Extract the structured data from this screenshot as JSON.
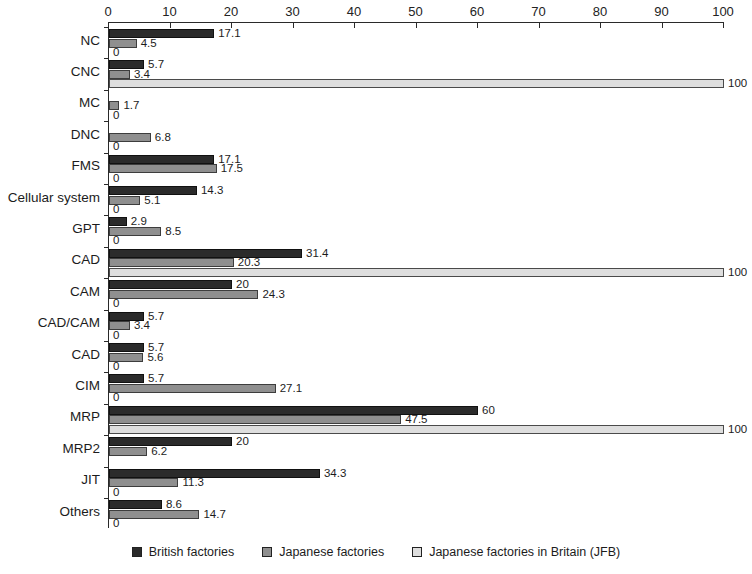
{
  "chart_data": {
    "type": "bar",
    "orientation": "horizontal",
    "title": "",
    "subtitle": "",
    "xlabel": "",
    "ylabel": "",
    "xlim": [
      0,
      100
    ],
    "xticks": [
      0,
      10,
      20,
      30,
      40,
      50,
      60,
      70,
      80,
      90,
      100
    ],
    "grid": false,
    "legend_position": "bottom",
    "categories": [
      "NC",
      "CNC",
      "MC",
      "DNC",
      "FMS",
      "Cellular system",
      "GPT",
      "CAD",
      "CAM",
      "CAD/CAM",
      "CAD",
      "CIM",
      "MRP",
      "MRP2",
      "JIT",
      "Others"
    ],
    "series": [
      {
        "name": "British factories",
        "color": "#2b2b2b",
        "values": [
          17.1,
          5.7,
          0,
          0,
          17.1,
          14.3,
          2.9,
          31.4,
          20,
          5.7,
          5.7,
          5.7,
          60,
          20,
          34.3,
          8.6
        ],
        "labels": [
          "17.1",
          "5.7",
          "",
          "",
          "17.1",
          "14.3",
          "2.9",
          "31.4",
          "20",
          "5.7",
          "5.7",
          "5.7",
          "60",
          "20",
          "34.3",
          "8.6"
        ]
      },
      {
        "name": "Japanese factories",
        "color": "#8f8f8f",
        "values": [
          4.5,
          3.4,
          1.7,
          6.8,
          17.5,
          5.1,
          8.5,
          20.3,
          24.3,
          3.4,
          5.6,
          27.1,
          47.5,
          6.2,
          11.3,
          14.7
        ],
        "labels": [
          "4.5",
          "3.4",
          "1.7",
          "6.8",
          "17.5",
          "5.1",
          "8.5",
          "20.3",
          "24.3",
          "3.4",
          "5.6",
          "27.1",
          "47.5",
          "6.2",
          "11.3",
          "14.7"
        ]
      },
      {
        "name": "Japanese factories in Britain (JFB)",
        "color": "#dedede",
        "values": [
          0,
          100,
          0,
          0,
          0,
          0,
          0,
          100,
          0,
          0,
          0,
          0,
          100,
          0,
          0,
          0
        ],
        "labels": [
          "0",
          "100",
          "0",
          "0",
          "0",
          "0",
          "0",
          "100",
          "0",
          "0",
          "0",
          "0",
          "100",
          "",
          "0",
          "0"
        ]
      }
    ]
  },
  "legend": {
    "items": [
      {
        "label": "British factories",
        "swatch": "#2b2b2b"
      },
      {
        "label": "Japanese factories",
        "swatch": "#8f8f8f"
      },
      {
        "label": "Japanese factories in Britain (JFB)",
        "swatch": "#dedede"
      }
    ]
  }
}
